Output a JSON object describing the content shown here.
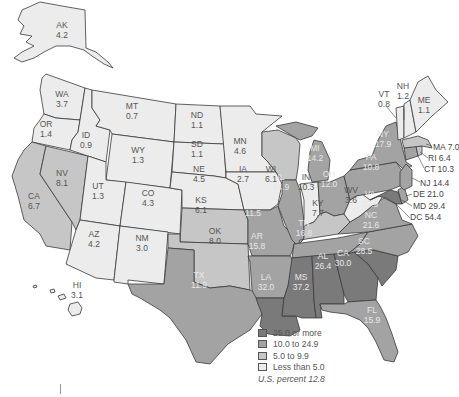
{
  "colors": {
    "c25": "#7a7a7a",
    "c10": "#a3a3a3",
    "c5": "#c6c6c6",
    "c0": "#ececec"
  },
  "legend": {
    "items": [
      {
        "label": "25.0 or more",
        "class": "c25"
      },
      {
        "label": "10.0 to 24.9",
        "class": "c10"
      },
      {
        "label": "5.0 to 9.9",
        "class": "c5"
      },
      {
        "label": "Less than 5.0",
        "class": "c0"
      }
    ],
    "note": "U.S. percent 12.8"
  },
  "states": {
    "AK": {
      "abbr": "AK",
      "value": "4.2"
    },
    "WA": {
      "abbr": "WA",
      "value": "3.7"
    },
    "OR": {
      "abbr": "OR",
      "value": "1.4"
    },
    "CA": {
      "abbr": "CA",
      "value": "6.7"
    },
    "NV": {
      "abbr": "NV",
      "value": "8.1"
    },
    "ID": {
      "abbr": "ID",
      "value": "0.9"
    },
    "MT": {
      "abbr": "MT",
      "value": "0.7"
    },
    "WY": {
      "abbr": "WY",
      "value": "1.3"
    },
    "UT": {
      "abbr": "UT",
      "value": "1.3"
    },
    "AZ": {
      "abbr": "AZ",
      "value": "4.2"
    },
    "CO": {
      "abbr": "CO",
      "value": "4.3"
    },
    "NM": {
      "abbr": "NM",
      "value": "3.0"
    },
    "ND": {
      "abbr": "ND",
      "value": "1.1"
    },
    "SD": {
      "abbr": "SD",
      "value": "1.1"
    },
    "NE": {
      "abbr": "NE",
      "value": "4.5"
    },
    "KS": {
      "abbr": "KS",
      "value": "6.1"
    },
    "OK": {
      "abbr": "OK",
      "value": "8.0"
    },
    "TX": {
      "abbr": "TX",
      "value": "11.9"
    },
    "MN": {
      "abbr": "MN",
      "value": "4.6"
    },
    "IA": {
      "abbr": "IA",
      "value": "2.7"
    },
    "MO": {
      "abbr": "MO",
      "value": "11.5"
    },
    "AR": {
      "abbr": "AR",
      "value": "15.8"
    },
    "LA": {
      "abbr": "LA",
      "value": "32.0"
    },
    "WI": {
      "abbr": "WI",
      "value": "6.1"
    },
    "IL": {
      "abbr": "IL",
      "value": "14.9"
    },
    "MI": {
      "abbr": "MI",
      "value": "14.2"
    },
    "IN": {
      "abbr": "IN",
      "value": "10.3"
    },
    "OH": {
      "abbr": "OH",
      "value": "12.0"
    },
    "KY": {
      "abbr": "KY",
      "value": "7.7"
    },
    "TN": {
      "abbr": "TN",
      "value": "16.8"
    },
    "MS": {
      "abbr": "MS",
      "value": "37.2"
    },
    "AL": {
      "abbr": "AL",
      "value": "26.4"
    },
    "GA": {
      "abbr": "CA",
      "value": "30.0"
    },
    "FL": {
      "abbr": "FL",
      "value": "15.9"
    },
    "SC": {
      "abbr": "SC",
      "value": "28.5"
    },
    "NC": {
      "abbr": "NC",
      "value": "21.6"
    },
    "VA": {
      "abbr": "VA",
      "value": "19.9"
    },
    "WV": {
      "abbr": "WV",
      "value": "3.6"
    },
    "PA": {
      "abbr": "PA",
      "value": "10.8"
    },
    "NY": {
      "abbr": "NY",
      "value": "17.9"
    },
    "VT": {
      "abbr": "VT",
      "value": "0.8"
    },
    "NH": {
      "abbr": "NH",
      "value": "1.2"
    },
    "ME": {
      "abbr": "ME",
      "value": "1.1"
    },
    "HI": {
      "abbr": "HI",
      "value": "3.1"
    }
  },
  "callouts": {
    "MA": "MA 7.0",
    "RI": "RI 6.4",
    "CT": "CT 10.3",
    "NJ": "NJ 14.4",
    "DE": "DE 21.0",
    "MD": "MD 29.4",
    "DC": "DC 54.4"
  }
}
